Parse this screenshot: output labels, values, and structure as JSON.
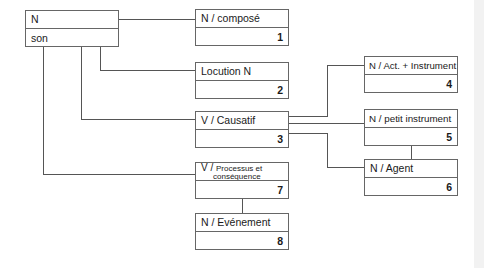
{
  "diagram": {
    "root": {
      "title": "N",
      "subtitle": "son"
    },
    "nodes": [
      {
        "id": 1,
        "label": "N / composé",
        "number": "1"
      },
      {
        "id": 2,
        "label": "Locution N",
        "number": "2"
      },
      {
        "id": 3,
        "label": "V / Causatif",
        "number": "3"
      },
      {
        "id": 4,
        "label": "N / Act. + Instrument",
        "number": "4"
      },
      {
        "id": 5,
        "label": "N / petit instrument",
        "number": "5"
      },
      {
        "id": 6,
        "label": "N / Agent",
        "number": "6"
      },
      {
        "id": 7,
        "label_prefix": "V / ",
        "label_line1": "Processus et",
        "label_line2": "conséquence",
        "number": "7"
      },
      {
        "id": 8,
        "label": "N / Evénement",
        "number": "8"
      }
    ],
    "edges": [
      [
        "root",
        1
      ],
      [
        "root",
        2
      ],
      [
        "root",
        3
      ],
      [
        "root",
        7
      ],
      [
        3,
        4
      ],
      [
        3,
        5
      ],
      [
        3,
        6
      ],
      [
        5,
        6
      ],
      [
        7,
        8
      ]
    ]
  }
}
